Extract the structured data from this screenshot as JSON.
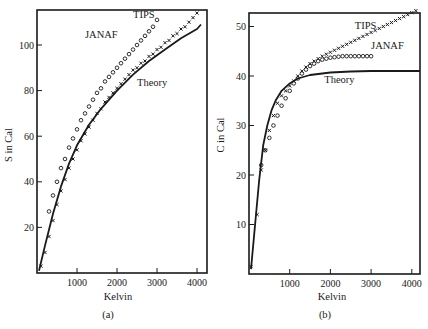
{
  "chart_data": [
    {
      "panel": "(a)",
      "type": "line",
      "xlabel": "Kelvin",
      "ylabel": "S in Cal",
      "xlim": [
        0,
        4200
      ],
      "ylim": [
        0,
        118
      ],
      "xticks": [
        1000,
        2000,
        3000,
        4000
      ],
      "yticks": [
        20,
        40,
        60,
        80,
        100
      ],
      "grid": false,
      "series": [
        {
          "name": "Theory",
          "style": "solid-line",
          "x": [
            50,
            200,
            400,
            600,
            800,
            1000,
            1300,
            1600,
            2000,
            2400,
            2800,
            3200,
            3600,
            4000,
            4100
          ],
          "y": [
            1,
            12,
            26,
            38,
            48,
            56,
            65,
            72,
            80,
            87,
            93,
            98,
            103,
            107,
            109
          ]
        },
        {
          "name": "TIPS",
          "style": "cross-markers",
          "x": [
            100,
            200,
            300,
            400,
            500,
            600,
            700,
            800,
            900,
            1000,
            1100,
            1200,
            1300,
            1400,
            1500,
            1600,
            1700,
            1800,
            1900,
            2000,
            2100,
            2200,
            2300,
            2400,
            2500,
            2600,
            2700,
            2800,
            2900,
            3000,
            3100,
            3200,
            3300,
            3400,
            3500,
            3600,
            3700,
            3800,
            3900,
            4000
          ],
          "y": [
            3,
            9,
            16,
            23,
            30,
            36,
            41,
            46,
            50,
            54,
            58,
            61,
            64,
            67,
            70,
            72,
            75,
            77,
            79,
            81,
            83,
            85,
            87,
            89,
            90,
            92,
            93,
            95,
            96,
            98,
            99,
            101,
            102,
            104,
            105,
            107,
            108,
            110,
            112,
            114
          ]
        },
        {
          "name": "JANAF",
          "style": "circle-markers",
          "x": [
            300,
            400,
            500,
            600,
            700,
            800,
            900,
            1000,
            1100,
            1200,
            1300,
            1400,
            1500,
            1600,
            1700,
            1800,
            1900,
            2000,
            2100,
            2200,
            2300,
            2400,
            2500,
            2600,
            2700,
            2800,
            2900,
            3000
          ],
          "y": [
            27,
            34,
            40,
            46,
            50,
            55,
            59,
            63,
            67,
            70,
            73,
            76,
            79,
            81,
            84,
            86,
            88,
            90,
            92,
            94,
            96,
            98,
            100,
            102,
            104,
            106,
            108,
            111
          ]
        }
      ],
      "annotations": [
        {
          "text": "JANAF",
          "x": 1200,
          "y": 103
        },
        {
          "text": "TIPS",
          "x": 2400,
          "y": 112
        },
        {
          "text": "Theory",
          "x": 2500,
          "y": 82
        }
      ]
    },
    {
      "panel": "(b)",
      "type": "line",
      "xlabel": "Kelvin",
      "ylabel": "C in Cal",
      "xlim": [
        0,
        4200
      ],
      "ylim": [
        0,
        52.5
      ],
      "xticks": [
        1000,
        2000,
        3000,
        4000
      ],
      "yticks": [
        10,
        20,
        30,
        40,
        50
      ],
      "grid": false,
      "series": [
        {
          "name": "Theory",
          "style": "solid-line",
          "x": [
            50,
            150,
            250,
            350,
            450,
            550,
            650,
            800,
            1000,
            1200,
            1500,
            2000,
            2500,
            3000,
            3500,
            4000,
            4200
          ],
          "y": [
            1,
            10,
            19,
            26,
            30,
            33,
            35,
            37,
            38.5,
            39.5,
            40.2,
            40.7,
            40.9,
            41,
            41,
            41,
            41
          ]
        },
        {
          "name": "TIPS",
          "style": "cross-markers",
          "x": [
            50,
            200,
            300,
            400,
            500,
            600,
            700,
            800,
            900,
            1000,
            1100,
            1200,
            1300,
            1400,
            1500,
            1600,
            1700,
            1800,
            1900,
            2000,
            2100,
            2200,
            2300,
            2400,
            2500,
            2600,
            2700,
            2800,
            2900,
            3000,
            3100,
            3200,
            3300,
            3400,
            3500,
            3600,
            3700,
            3800,
            3900,
            4000,
            4100
          ],
          "y": [
            1.5,
            12,
            21,
            25,
            29,
            32,
            34.5,
            36,
            37,
            38,
            39,
            40,
            41,
            41.8,
            42.5,
            43,
            43.5,
            44,
            44.4,
            44.8,
            45.2,
            45.6,
            46,
            46.4,
            46.8,
            47.2,
            47.6,
            48,
            48.4,
            48.8,
            49.2,
            49.6,
            50,
            50.4,
            50.8,
            51.2,
            51.6,
            52,
            52.4,
            52.8,
            53.2
          ]
        },
        {
          "name": "JANAF",
          "style": "circle-markers",
          "x": [
            300,
            400,
            500,
            600,
            700,
            800,
            900,
            1000,
            1100,
            1200,
            1300,
            1400,
            1500,
            1600,
            1700,
            1800,
            1900,
            2000,
            2100,
            2200,
            2300,
            2400,
            2500,
            2600,
            2700,
            2800,
            2900,
            3000
          ],
          "y": [
            22,
            25,
            27.5,
            30,
            32,
            34,
            35.5,
            37,
            38.5,
            39.5,
            40.5,
            41.3,
            42,
            42.5,
            43,
            43.3,
            43.5,
            43.7,
            43.8,
            43.9,
            44,
            44,
            44,
            44,
            44,
            44,
            44,
            44
          ]
        }
      ],
      "annotations": [
        {
          "text": "TIPS",
          "x": 2600,
          "y": 49.5
        },
        {
          "text": "JANAF",
          "x": 3000,
          "y": 45.5
        },
        {
          "text": "Theory",
          "x": 1850,
          "y": 38.5
        }
      ]
    }
  ],
  "figure": {
    "panels": [
      {
        "label": "(a)",
        "xlabel": "Kelvin",
        "ylabel": "S in Cal",
        "frame": {
          "left": 37,
          "top": 10,
          "right": 207,
          "bottom": 273
        },
        "x_px_per_unit": 0.04,
        "y_px_per_unit": 2.28,
        "label_pos": {
          "x": 108,
          "y": 318
        },
        "xlabel_pos": {
          "x": 118,
          "y": 300
        },
        "ylabel_pos": {
          "x": 12,
          "y": 145
        }
      },
      {
        "label": "(b)",
        "xlabel": "Kelvin",
        "ylabel": "C in Cal",
        "frame": {
          "left": 249,
          "top": 13,
          "right": 420,
          "bottom": 274
        },
        "x_px_per_unit": 0.0407,
        "y_px_per_unit": 4.95,
        "label_pos": {
          "x": 325,
          "y": 318
        },
        "xlabel_pos": {
          "x": 332,
          "y": 300
        },
        "ylabel_pos": {
          "x": 224,
          "y": 135
        }
      }
    ],
    "colors": {
      "ink": "#1a1a1a",
      "background": "#ffffff"
    }
  }
}
